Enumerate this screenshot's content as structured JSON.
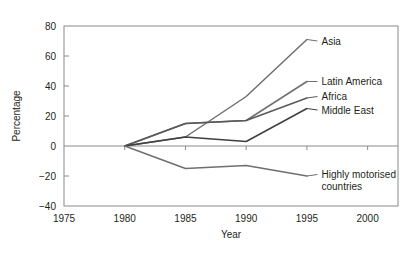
{
  "chart_data": {
    "type": "line",
    "title": "",
    "xlabel": "Year",
    "ylabel": "Percentage",
    "xlim": [
      1975,
      2002.5
    ],
    "ylim": [
      -40,
      80
    ],
    "xticks": [
      1975,
      1980,
      1985,
      1990,
      1995,
      2000
    ],
    "yticks": [
      -40,
      -20,
      0,
      20,
      40,
      60,
      80
    ],
    "xtick_labels": [
      "1975",
      "1980",
      "1985",
      "1990",
      "1995",
      "2000"
    ],
    "ytick_labels": [
      "−40",
      "−20",
      "0",
      "20",
      "40",
      "60",
      "80"
    ],
    "grid": false,
    "legend": "inline-right-labels",
    "x": [
      1980,
      1985,
      1990,
      1995
    ],
    "series": [
      {
        "name": "Asia",
        "label": "Asia",
        "color": "#6f6f6f",
        "values": [
          0,
          6,
          33,
          71
        ],
        "label_x": 1996.2,
        "label_y": 70
      },
      {
        "name": "Latin America",
        "label": "Latin America",
        "color": "#6f6f6f",
        "values": [
          0,
          15,
          17,
          43
        ],
        "label_x": 1996.2,
        "label_y": 43
      },
      {
        "name": "Africa",
        "label": "Africa",
        "color": "#595959",
        "values": [
          0,
          15,
          17,
          32
        ],
        "label_x": 1996.2,
        "label_y": 33
      },
      {
        "name": "Middle East",
        "label": "Middle East",
        "color": "#3f3f3f",
        "values": [
          0,
          6,
          3,
          25
        ],
        "label_x": 1996.2,
        "label_y": 24
      },
      {
        "name": "Highly motorised countries",
        "label": "Highly motorised",
        "label_line2": "countries",
        "color": "#6f6f6f",
        "values": [
          0,
          -15,
          -13,
          -20
        ],
        "label_x": 1996.2,
        "label_y": -19
      }
    ]
  },
  "axis": {
    "y_title": "Percentage",
    "x_title": "Year"
  }
}
